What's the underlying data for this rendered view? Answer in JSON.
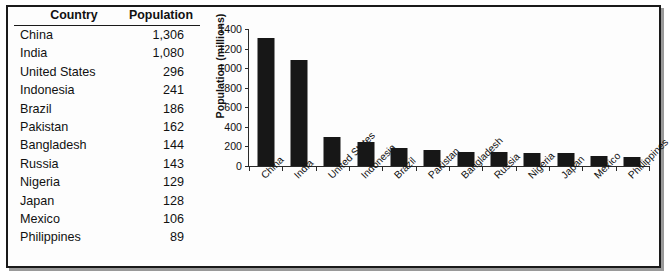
{
  "figure": {
    "background_color": "#ffffff",
    "border_color": "#1a1a1a"
  },
  "table": {
    "headers": [
      "Country",
      "Population"
    ],
    "rows": [
      {
        "country": "China",
        "population": "1,306"
      },
      {
        "country": "India",
        "population": "1,080"
      },
      {
        "country": "United States",
        "population": "296"
      },
      {
        "country": "Indonesia",
        "population": "241"
      },
      {
        "country": "Brazil",
        "population": "186"
      },
      {
        "country": "Pakistan",
        "population": "162"
      },
      {
        "country": "Bangladesh",
        "population": "144"
      },
      {
        "country": "Russia",
        "population": "143"
      },
      {
        "country": "Nigeria",
        "population": "129"
      },
      {
        "country": "Japan",
        "population": "128"
      },
      {
        "country": "Mexico",
        "population": "106"
      },
      {
        "country": "Philippines",
        "population": "89"
      }
    ]
  },
  "chart_data": {
    "type": "bar",
    "title": "",
    "xlabel": "",
    "ylabel": "Population (millions)",
    "categories": [
      "China",
      "India",
      "United States",
      "Indonesia",
      "Brazil",
      "Pakistan",
      "Bangladesh",
      "Russia",
      "Nigeria",
      "Japan",
      "Mexico",
      "Phillippines"
    ],
    "values": [
      1306,
      1080,
      296,
      241,
      186,
      162,
      144,
      143,
      129,
      128,
      106,
      89
    ],
    "ylim": [
      0,
      1400
    ],
    "ytick_values": [
      0,
      200,
      400,
      600,
      800,
      1000,
      1200,
      1400
    ],
    "ytick_labels": [
      "0",
      "200",
      "400",
      "600",
      "800",
      "1000",
      "1200",
      "1400"
    ],
    "grid": false,
    "legend": false,
    "bar_color": "#171717",
    "axis_color": "#2a2a2a",
    "xtick_label_rotation": -45
  }
}
